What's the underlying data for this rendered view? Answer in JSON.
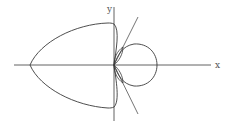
{
  "figure": {
    "type": "polar-curve-plot",
    "axes": {
      "x_label": "x",
      "y_label": "y"
    },
    "elements": [
      "large-left-loop",
      "right-circle-loop",
      "upper-inner-lens-loop",
      "lower-inner-lens-loop",
      "upper-tangent-line",
      "lower-tangent-line"
    ],
    "colors": {
      "stroke": "#3a3a3a",
      "background": "#ffffff"
    }
  }
}
